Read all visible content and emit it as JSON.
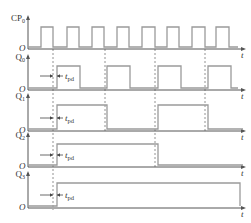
{
  "diagram": {
    "type": "timing-diagram",
    "time_axis_label": "t",
    "origin_label": "O",
    "delay_label": "t",
    "delay_subscript": "pd",
    "colors": {
      "waveform": "#9a9a9a",
      "axis": "#555555",
      "dashed": "#777777",
      "text": "#333333"
    },
    "signals": [
      {
        "name": "CP",
        "subscript": "0",
        "axis_y": 49,
        "high_y": 27,
        "edges": [
          [
            41,
            53
          ],
          [
            67,
            79
          ],
          [
            92,
            104
          ],
          [
            117,
            129
          ],
          [
            142,
            155
          ],
          [
            167,
            179
          ],
          [
            192,
            205
          ],
          [
            216,
            229
          ]
        ],
        "end_x": 238
      },
      {
        "name": "Q",
        "subscript": "0",
        "axis_y": 90,
        "high_y": 66,
        "edges": [
          [
            57,
            80
          ],
          [
            107,
            130
          ],
          [
            158,
            181
          ],
          [
            208,
            231
          ]
        ],
        "end_x": 238
      },
      {
        "name": "Q",
        "subscript": "1",
        "axis_y": 131,
        "high_y": 105,
        "edges": [
          [
            57,
            107
          ],
          [
            158,
            208
          ]
        ],
        "end_x": 243
      },
      {
        "name": "Q",
        "subscript": "2",
        "axis_y": 167,
        "high_y": 144,
        "edges": [
          [
            57,
            158
          ]
        ],
        "end_x": 243
      },
      {
        "name": "Q",
        "subscript": "3",
        "axis_y": 208,
        "high_y": 183,
        "edges": [
          [
            57,
            240
          ]
        ],
        "end_x": 240
      }
    ],
    "dashed_lines_x": [
      53,
      105,
      155,
      205
    ],
    "tpd_markers": [
      {
        "signal": "Q0",
        "y": 76
      },
      {
        "signal": "Q1",
        "y": 118
      },
      {
        "signal": "Q2",
        "y": 155
      },
      {
        "signal": "Q3",
        "y": 195
      }
    ]
  }
}
